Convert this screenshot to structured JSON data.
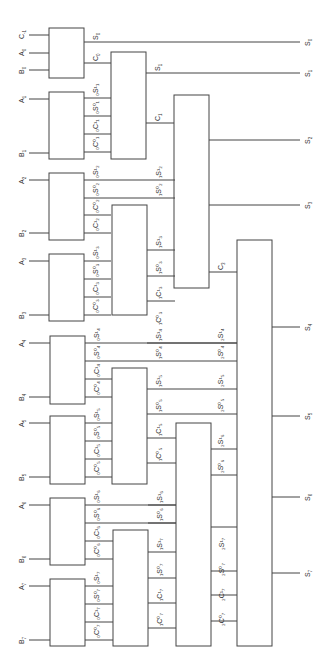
{
  "diagram": {
    "type": "carry-select adder (conditional sum) block diagram, rotated 90 degrees",
    "colors": {
      "line": "#444444",
      "text": "#333333",
      "background": "#ffffff"
    },
    "inputs": {
      "c_in": {
        "main": "C",
        "sub": "-1"
      },
      "a": [
        {
          "main": "A",
          "sub": "0"
        },
        {
          "main": "A",
          "sub": "1"
        },
        {
          "main": "A",
          "sub": "2"
        },
        {
          "main": "A",
          "sub": "3"
        },
        {
          "main": "A",
          "sub": "4"
        },
        {
          "main": "A",
          "sub": "5"
        },
        {
          "main": "A",
          "sub": "6"
        },
        {
          "main": "A",
          "sub": "7"
        }
      ],
      "b": [
        {
          "main": "B",
          "sub": "0"
        },
        {
          "main": "B",
          "sub": "1"
        },
        {
          "main": "B",
          "sub": "2"
        },
        {
          "main": "B",
          "sub": "3"
        },
        {
          "main": "B",
          "sub": "4"
        },
        {
          "main": "B",
          "sub": "5"
        },
        {
          "main": "B",
          "sub": "6"
        },
        {
          "main": "B",
          "sub": "7"
        }
      ]
    },
    "outputs": [
      {
        "main": "S",
        "sub": "0"
      },
      {
        "main": "S",
        "sub": "1"
      },
      {
        "main": "S",
        "sub": "2"
      },
      {
        "main": "S",
        "sub": "3"
      },
      {
        "main": "S",
        "sub": "4"
      },
      {
        "main": "S",
        "sub": "5"
      },
      {
        "main": "S",
        "sub": "6"
      },
      {
        "main": "S",
        "sub": "7"
      }
    ],
    "stage0_labels": {
      "s0": {
        "main": "S",
        "sub": "0"
      },
      "c0": {
        "main": "C",
        "sub": "0"
      },
      "bit1": [
        "₀S¹₁",
        "₀S⁰₁",
        "₀C¹₁",
        "₀C⁰₁"
      ],
      "bit2": [
        "₀S¹₂",
        "₀S⁰₂",
        "₀C⁰₂",
        "₀C¹₂"
      ],
      "bit3": [
        "₀S¹₃",
        "₀S⁰₃",
        "₀C¹₃",
        "₀C⁰₃"
      ],
      "bit4": [
        "₀S¹₄",
        "₀S⁰₄",
        "₀C¹₄",
        "₀C⁰₄"
      ],
      "bit5": [
        "₀S¹₅",
        "₀S⁰₅",
        "₀C¹₅",
        "₀C⁰₅"
      ],
      "bit6": [
        "₀S¹₆",
        "₀S⁰₆",
        "₀C¹₆",
        "₀C⁰₆"
      ],
      "bit7": [
        "₀S¹₇",
        "₀S⁰₇",
        "₀C¹₇",
        "₀C⁰₇"
      ]
    },
    "stage1_labels": {
      "s1": {
        "main": "S",
        "sub": "1"
      },
      "c1": {
        "main": "C",
        "sub": "1"
      },
      "group23": [
        "₁S¹₂",
        "₁S⁰₂",
        "₁S¹₃",
        "₁S⁰₃",
        "₁C¹₃",
        "₁C⁰₃"
      ],
      "group45": [
        "₁S¹₄",
        "₁S⁰₄",
        "₁S¹₅",
        "₁S⁰₅",
        "₁C¹₅",
        "₁C⁰₅"
      ],
      "group67": [
        "₁S¹₆",
        "₁S⁰₆",
        "₁S¹₇",
        "₁S⁰₇",
        "₁C¹₇",
        "₁C⁰₇"
      ]
    },
    "stage2_labels": {
      "c3": {
        "main": "C",
        "sub": "3"
      },
      "group4_7": [
        "₂S¹₄",
        "₂S⁰₄",
        "₂S¹₅",
        "₂S⁰₅",
        "₂S¹₆",
        "₂S⁰₆",
        "₂S¹₇",
        "₂S⁰₇",
        "₂C¹₇",
        "₂C⁰₇"
      ]
    }
  }
}
